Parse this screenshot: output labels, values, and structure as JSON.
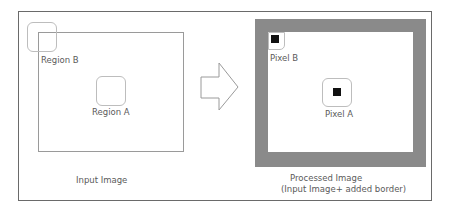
{
  "diagram": {
    "input": {
      "caption": "Input Image",
      "regions": [
        {
          "id": "A",
          "label": "Region A"
        },
        {
          "id": "B",
          "label": "Region B"
        }
      ]
    },
    "arrow": {
      "icon": "right-arrow-outline-icon"
    },
    "output": {
      "caption_line1": "Processed Image",
      "caption_line2": "(Input Image+ added border)",
      "pixels": [
        {
          "id": "A",
          "label": "Pixel A"
        },
        {
          "id": "B",
          "label": "Pixel B"
        }
      ],
      "border_color": "#8a8a8a",
      "pixel_color": "#111111"
    }
  }
}
